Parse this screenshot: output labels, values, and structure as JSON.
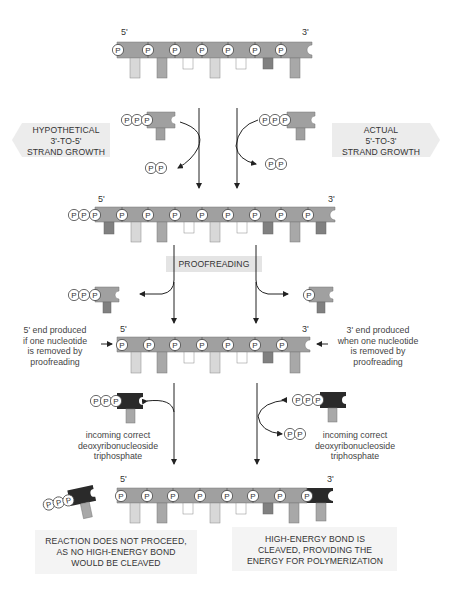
{
  "diagram": {
    "type": "DNA replication strand direction and proofreading",
    "colors": {
      "backbone": "#a0a0a0",
      "base_light": "#d8d8d8",
      "base_mid": "#a8a8a8",
      "base_white": "#ffffff",
      "base_dark": "#808080",
      "incoming_dark": "#2a2a2a",
      "label_box": "#ececec",
      "line": "#222222"
    },
    "strands": [
      {
        "id": "strand-1",
        "five_prime": "5'",
        "three_prime": "3'",
        "phosphates": 7
      },
      {
        "id": "strand-2",
        "five_prime": "5'",
        "three_prime": "3'",
        "phosphates": 9,
        "triphosphate_at_5prime": true
      },
      {
        "id": "strand-3",
        "five_prime": "5'",
        "three_prime": "3'",
        "phosphates": 7
      },
      {
        "id": "strand-4",
        "five_prime": "5'",
        "three_prime": "3'",
        "phosphates": 8,
        "new_nucleotide_at_3prime": true
      }
    ]
  },
  "labels": {
    "hypothetical": "HYPOTHETICAL\n3'-TO-5'\nSTRAND GROWTH",
    "actual": "ACTUAL\n5'-TO-3'\nSTRAND GROWTH",
    "proofreading": "PROOFREADING",
    "five_end_note": "5' end produced\nif one nucleotide\nis removed by\nproofreading",
    "three_end_note": "3' end produced\nwhen one nucleotide\nis removed by\nproofreading",
    "incoming_left": "incoming correct\ndeoxyribonucleoside\ntriphosphate",
    "incoming_right": "incoming correct\ndeoxyribonucleoside\ntriphosphate",
    "result_left": "REACTION DOES NOT PROCEED,\nAS NO HIGH-ENERGY BOND\nWOULD BE CLEAVED",
    "result_right": "HIGH-ENERGY BOND IS\nCLEAVED, PROVIDING THE\nENERGY FOR POLYMERIZATION"
  },
  "ends": {
    "s1_5": "5'",
    "s1_3": "3'",
    "s2_5": "5'",
    "s2_3": "3'",
    "s3_5": "5'",
    "s3_3": "3'",
    "s4_5": "5'",
    "s4_3": "3'"
  },
  "phosphate_symbol": "P"
}
